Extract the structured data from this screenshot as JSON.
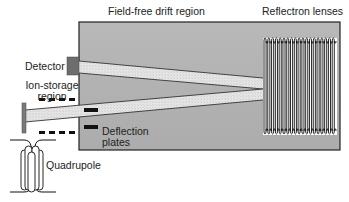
{
  "diagram": {
    "type": "reflectron time-of-flight mass spectrometer schematic",
    "labels": {
      "drift_region": "Field-free drift region",
      "reflectron": "Reflectron lenses",
      "detector": "Detector",
      "ion_storage_line1": "Ion-storage",
      "ion_storage_line2": "region",
      "deflection_line1": "Deflection",
      "deflection_line2": "plates",
      "quadrupole": "Quadrupole"
    },
    "colors": {
      "drift_region_fill": "#b4b4b4",
      "beam_fill": "#e2e2e2",
      "detector_fill": "#6e6e6e",
      "outline": "#222222",
      "lens_fill": "#ffffff"
    }
  }
}
